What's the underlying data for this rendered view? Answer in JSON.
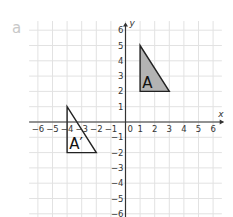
{
  "question_label": "a",
  "axes": {
    "x_label": "x",
    "y_label": "y",
    "x_ticks": [
      "−6",
      "−5",
      "−4",
      "−3",
      "−2",
      "−1",
      "0",
      "1",
      "2",
      "3",
      "4",
      "5",
      "6"
    ],
    "y_ticks": [
      "6",
      "5",
      "4",
      "3",
      "2",
      "1",
      "−1",
      "−2",
      "−3",
      "−4",
      "−5",
      "−6"
    ]
  },
  "shapes": {
    "A": {
      "label": "A",
      "vertices": [
        [
          1,
          5
        ],
        [
          1,
          2
        ],
        [
          3,
          2
        ]
      ],
      "fill": "#b3b3b3"
    },
    "A_prime": {
      "label": "A′",
      "vertices": [
        [
          -4,
          1
        ],
        [
          -4,
          -2
        ],
        [
          -2,
          -2
        ]
      ],
      "fill": "none"
    }
  },
  "chart_data": {
    "type": "diagram",
    "title": "",
    "xlabel": "x",
    "ylabel": "y",
    "xlim": [
      -6,
      6
    ],
    "ylim": [
      -6,
      6
    ],
    "grid": true,
    "shapes": [
      {
        "name": "A",
        "vertices": [
          [
            1,
            5
          ],
          [
            1,
            2
          ],
          [
            3,
            2
          ]
        ],
        "filled": true
      },
      {
        "name": "A′",
        "vertices": [
          [
            -4,
            1
          ],
          [
            -4,
            -2
          ],
          [
            -2,
            -2
          ]
        ],
        "filled": false
      }
    ]
  }
}
